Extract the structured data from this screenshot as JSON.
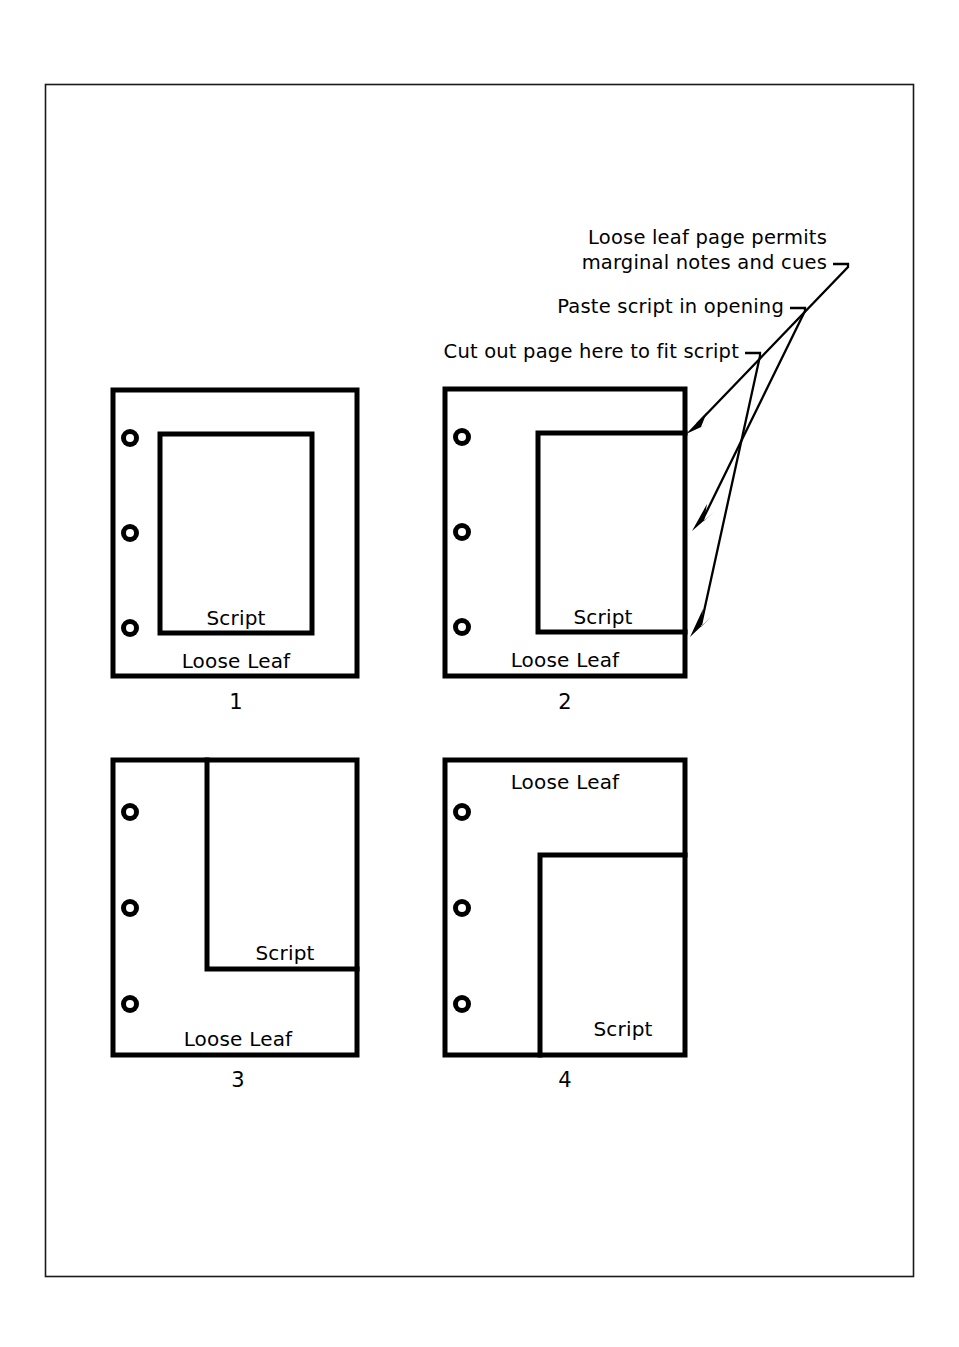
{
  "page": {
    "background_color": "#ffffff",
    "ink_color": "#000000",
    "border_color": "#1a1a1a"
  },
  "annotations": [
    {
      "id": "annot-loose-leaf-permits",
      "line1": "Loose leaf page permits",
      "line2": "marginal notes and cues",
      "target": "figure-2 cut-out top-right corner"
    },
    {
      "id": "annot-paste-script",
      "line1": "Paste script in opening",
      "line2": "",
      "target": "figure-2 script opening right edge"
    },
    {
      "id": "annot-cut-out-page",
      "line1": "Cut out page here to fit script",
      "line2": "",
      "target": "figure-2 cut-out bottom-right corner"
    }
  ],
  "figures": [
    {
      "id": "figure-1",
      "number": "1",
      "loose_leaf_label": "Loose Leaf",
      "script_label": "Script",
      "loose_leaf_label_position": "bottom",
      "hole_count": 3,
      "description": "Full loose leaf sheet with closed script rectangle inset"
    },
    {
      "id": "figure-2",
      "number": "2",
      "loose_leaf_label": "Loose Leaf",
      "script_label": "Script",
      "loose_leaf_label_position": "bottom",
      "hole_count": 3,
      "description": "Script opening cut through to the right edge of the sheet"
    },
    {
      "id": "figure-3",
      "number": "3",
      "loose_leaf_label": "Loose Leaf",
      "script_label": "Script",
      "loose_leaf_label_position": "bottom",
      "hole_count": 3,
      "description": "Script opening cut through the top and right edges"
    },
    {
      "id": "figure-4",
      "number": "4",
      "loose_leaf_label": "Loose Leaf",
      "script_label": "Script",
      "loose_leaf_label_position": "top",
      "hole_count": 3,
      "description": "Script opening cut through the bottom and right edges"
    }
  ]
}
